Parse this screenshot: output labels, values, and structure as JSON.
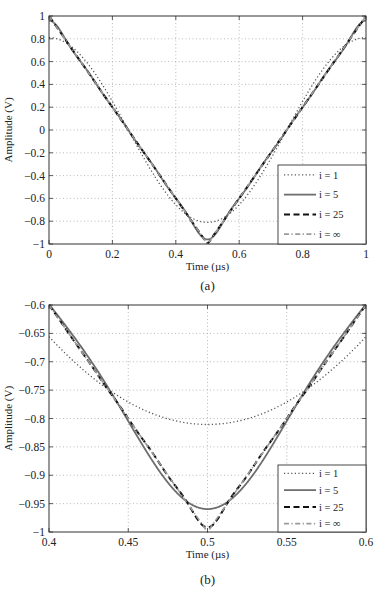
{
  "chart_data": [
    {
      "id": "a",
      "type": "line",
      "caption": "(a)",
      "title": "",
      "xlabel": "Time (µs)",
      "ylabel": "Amplitude (V)",
      "xlim": [
        0,
        1
      ],
      "ylim": [
        -1,
        1
      ],
      "xticks": [
        0,
        0.2,
        0.4,
        0.6,
        0.8,
        1
      ],
      "xtick_labels": [
        "0",
        "0.2",
        "0.4",
        "0.6",
        "0.8",
        "1"
      ],
      "yticks": [
        -1,
        -0.8,
        -0.6,
        -0.4,
        -0.2,
        0,
        0.2,
        0.4,
        0.6,
        0.8,
        1
      ],
      "ytick_labels": [
        "−1",
        "−0.8",
        "−0.6",
        "−0.4",
        "−0.2",
        "0",
        "0.2",
        "0.4",
        "0.6",
        "0.8",
        "1"
      ],
      "grid": true,
      "legend_position": "lower right",
      "description": "Fourier series partial sums of a triangle wave (1 at t=0 and t=1, -1 at t=0.5)",
      "series": [
        {
          "name": "i = 1",
          "harmonics": 1,
          "style": "dotted",
          "min_value": -0.811
        },
        {
          "name": "i = 5",
          "harmonics": 5,
          "style": "solid",
          "min_value": -0.933
        },
        {
          "name": "i = 25",
          "harmonics": 25,
          "style": "dashed",
          "min_value": -0.984
        },
        {
          "name": "i = ∞",
          "harmonics": "infinity",
          "style": "dashdot",
          "min_value": -1
        }
      ]
    },
    {
      "id": "b",
      "type": "line",
      "caption": "(b)",
      "title": "",
      "xlabel": "Time (µs)",
      "ylabel": "Amplitude (V)",
      "xlim": [
        0.4,
        0.6
      ],
      "ylim": [
        -1,
        -0.6
      ],
      "xticks": [
        0.4,
        0.45,
        0.5,
        0.55,
        0.6
      ],
      "xtick_labels": [
        "0.4",
        "0.45",
        "0.5",
        "0.55",
        "0.6"
      ],
      "yticks": [
        -1,
        -0.95,
        -0.9,
        -0.85,
        -0.8,
        -0.75,
        -0.7,
        -0.65,
        -0.6
      ],
      "ytick_labels": [
        "−1",
        "−0.95",
        "−0.9",
        "−0.85",
        "−0.8",
        "−0.75",
        "−0.7",
        "−0.65",
        "−0.6"
      ],
      "grid": true,
      "legend_position": "lower right",
      "description": "Zoomed view of the triangle-wave minimum near t = 0.5",
      "series": [
        {
          "name": "i = 1",
          "harmonics": 1,
          "style": "dotted",
          "min_value": -0.811
        },
        {
          "name": "i = 5",
          "harmonics": 5,
          "style": "solid",
          "min_value": -0.933
        },
        {
          "name": "i = 25",
          "harmonics": 25,
          "style": "dashed",
          "min_value": -0.984
        },
        {
          "name": "i = ∞",
          "harmonics": "infinity",
          "style": "dashdot",
          "min_value": -1
        }
      ]
    }
  ],
  "layout": {
    "plots": [
      {
        "left": 49,
        "top": 16,
        "right": 366,
        "bottom": 244,
        "caption_y": 290,
        "xlabel_y": 270
      },
      {
        "left": 49,
        "top": 305,
        "right": 366,
        "bottom": 532,
        "caption_y": 584,
        "xlabel_y": 558
      }
    ],
    "legends": [
      {
        "x": 278,
        "y": 165,
        "w": 88,
        "h": 79
      },
      {
        "x": 278,
        "y": 465,
        "w": 88,
        "h": 67
      }
    ]
  },
  "colors": {
    "axis": "#333333",
    "grid": "#a8a8a8",
    "i1": "#555555",
    "i5": "#6e6e6e",
    "i25": "#111111",
    "iinf": "#9a9a9a"
  }
}
